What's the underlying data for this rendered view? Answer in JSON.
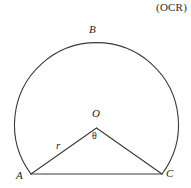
{
  "attribution": {
    "text": "(OCR)"
  },
  "figure": {
    "stroke_color": "#3a3a3a",
    "background_color": "#ffffff",
    "labels": {
      "arc_top": "B",
      "center": "O",
      "angle": "θ",
      "radius": "r",
      "left_point": "A",
      "right_point": "C"
    },
    "geometry": {
      "center_x": 96.5,
      "center_y": 128,
      "radius": 82,
      "point_A_x": 31,
      "point_A_y": 174,
      "point_C_x": 162,
      "point_C_y": 174,
      "arc_top_y": 38
    }
  }
}
